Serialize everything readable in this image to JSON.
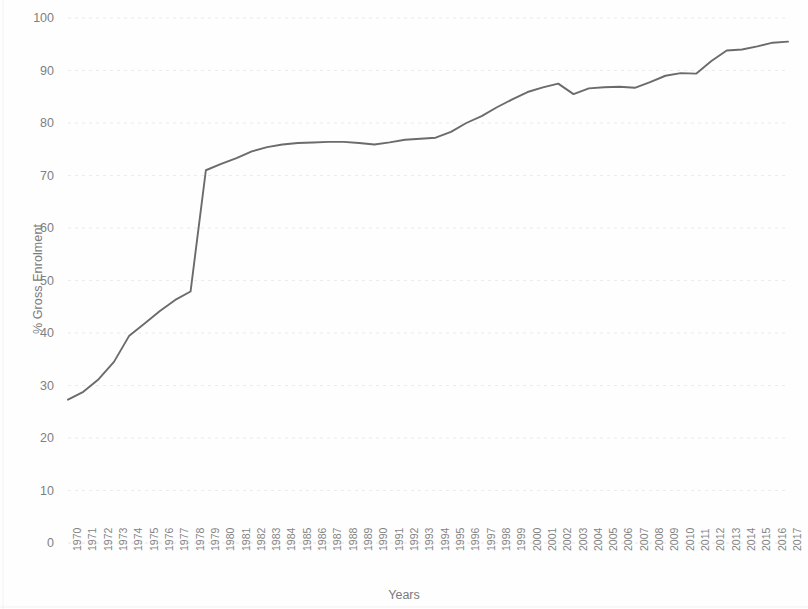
{
  "chart_data": {
    "type": "line",
    "title": "",
    "subtitle": "",
    "xlabel": "Years",
    "ylabel": "% Gross Enrolment",
    "xlim": [
      1970,
      2017
    ],
    "ylim": [
      0,
      100
    ],
    "y_ticks": [
      0,
      10,
      20,
      30,
      40,
      50,
      60,
      70,
      80,
      90,
      100
    ],
    "grid": true,
    "grid_axis": "y",
    "legend": "none",
    "series_color": "#6b6b6b",
    "categories": [
      "1970",
      "1971",
      "1972",
      "1973",
      "1974",
      "1975",
      "1976",
      "1977",
      "1978",
      "1979",
      "1980",
      "1981",
      "1982",
      "1983",
      "1984",
      "1985",
      "1986",
      "1987",
      "1988",
      "1989",
      "1990",
      "1991",
      "1992",
      "1993",
      "1994",
      "1995",
      "1996",
      "1997",
      "1998",
      "1999",
      "2000",
      "2001",
      "2002",
      "2003",
      "2004",
      "2005",
      "2006",
      "2007",
      "2008",
      "2009",
      "2010",
      "2011",
      "2012",
      "2013",
      "2014",
      "2015",
      "2016",
      "2017"
    ],
    "values": [
      27.3,
      28.8,
      31.2,
      34.5,
      39.5,
      41.8,
      44.2,
      46.3,
      47.9,
      71.0,
      72.2,
      73.3,
      74.6,
      75.4,
      75.9,
      76.2,
      76.3,
      76.4,
      76.4,
      76.2,
      75.9,
      76.3,
      76.8,
      77.0,
      77.2,
      78.3,
      80.0,
      81.3,
      83.0,
      84.5,
      85.9,
      86.8,
      87.5,
      85.5,
      86.6,
      86.8,
      86.9,
      86.7,
      87.8,
      89.0,
      89.5,
      89.4,
      91.8,
      93.8,
      94.0,
      94.6,
      95.3,
      95.5
    ]
  }
}
